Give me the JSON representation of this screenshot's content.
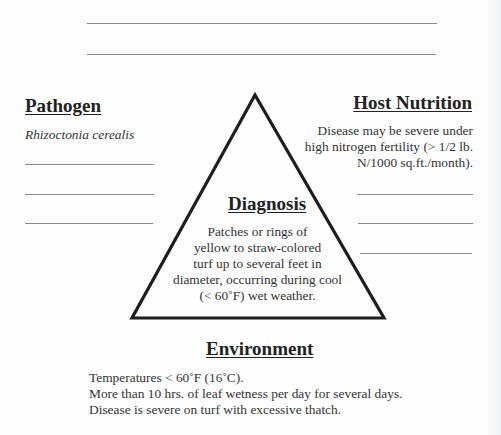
{
  "top_lines": 2,
  "pathogen": {
    "heading": "Pathogen",
    "organism": "Rhizoctonia cerealis",
    "blank_lines": 3
  },
  "host_nutrition": {
    "heading": "Host Nutrition",
    "lines": [
      "Disease may be severe under",
      "high nitrogen fertility (> 1/2 lb.",
      "N/1000 sq.ft./month)."
    ],
    "blank_lines": 3
  },
  "diagnosis": {
    "heading": "Diagnosis",
    "lines": [
      "Patches or rings of",
      "yellow to straw-colored",
      "turf up to several feet in",
      "diameter, occurring during cool",
      "(< 60˚F) wet weather."
    ]
  },
  "environment": {
    "heading": "Environment",
    "lines": [
      "Temperatures < 60˚F (16˚C).",
      "More than 10 hrs. of leaf wetness per day for several days.",
      "Disease is severe on turf with excessive thatch."
    ]
  },
  "colors": {
    "ink": "#222222",
    "rule": "#8a8a8a",
    "background": "#fefefe"
  }
}
